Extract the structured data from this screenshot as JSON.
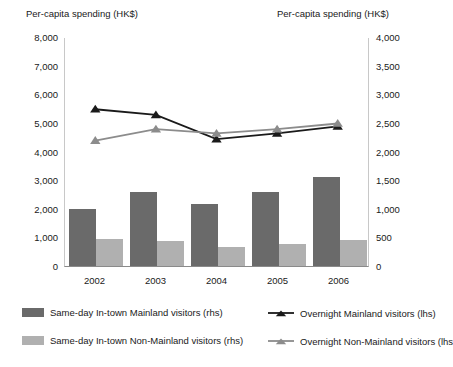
{
  "axes": {
    "left_title": "Per-capita spending (HK$)",
    "right_title": "Per-capita spending (HK$)",
    "left_ticks": [
      "8,000",
      "7,000",
      "6,000",
      "5,000",
      "4,000",
      "3,000",
      "2,000",
      "1,000",
      "0"
    ],
    "right_ticks": [
      "4,000",
      "3,500",
      "3,000",
      "2,500",
      "2,000",
      "1,500",
      "1,000",
      "500",
      "0"
    ]
  },
  "legend": [
    {
      "label": "Same-day In-town Mainland visitors (rhs)",
      "marker": "swatch-dark",
      "color": "#6a6a6a"
    },
    {
      "label": "Same-day In-town Non-Mainland visitors (rhs)",
      "marker": "swatch-light",
      "color": "#b0b0b0"
    },
    {
      "label": "Overnight Mainland visitors (lhs)",
      "marker": "line-dark",
      "color": "#1a1a1a"
    },
    {
      "label": "Overnight Non-Mainland visitors (lhs",
      "marker": "line-light",
      "color": "#8c8c8c"
    }
  ],
  "chart_data": {
    "type": "bar",
    "title": "",
    "xlabel": "",
    "ylabel": "Per-capita spending (HK$)",
    "categories": [
      "2002",
      "2003",
      "2004",
      "2005",
      "2006"
    ],
    "ylim": [
      0,
      8000
    ],
    "y2lim": [
      0,
      4000
    ],
    "grid": false,
    "legend_position": "bottom",
    "series": [
      {
        "name": "Same-day In-town Mainland visitors (rhs)",
        "type": "bar",
        "axis": "right",
        "color": "#6a6a6a",
        "values": [
          1000,
          1300,
          1080,
          1300,
          1550
        ]
      },
      {
        "name": "Same-day In-town Non-Mainland visitors (rhs)",
        "type": "bar",
        "axis": "right",
        "color": "#b0b0b0",
        "values": [
          480,
          430,
          330,
          380,
          450
        ]
      },
      {
        "name": "Overnight Mainland visitors (lhs)",
        "type": "line",
        "axis": "left",
        "color": "#1a1a1a",
        "marker": "triangle",
        "values": [
          5500,
          5300,
          4450,
          4650,
          4900
        ]
      },
      {
        "name": "Overnight Non-Mainland visitors (lhs)",
        "type": "line",
        "axis": "left",
        "color": "#8c8c8c",
        "marker": "triangle",
        "values": [
          4400,
          4800,
          4650,
          4800,
          5000
        ]
      }
    ]
  }
}
